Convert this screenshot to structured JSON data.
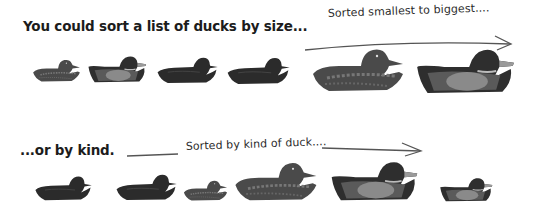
{
  "top": {
    "heading": "You could sort a list of ducks by size...",
    "annotation": "Sorted smallest to biggest....",
    "ducks": [
      {
        "kind": "female-mallard",
        "size": "smallest"
      },
      {
        "kind": "male-mallard",
        "size": "small"
      },
      {
        "kind": "dark-duck",
        "size": "medium"
      },
      {
        "kind": "dark-duck",
        "size": "medium"
      },
      {
        "kind": "female-mallard",
        "size": "big"
      },
      {
        "kind": "male-mallard",
        "size": "biggest"
      }
    ]
  },
  "bottom": {
    "heading": "...or by kind.",
    "annotation": "Sorted by kind of duck....",
    "ducks": [
      {
        "kind": "dark-duck"
      },
      {
        "kind": "dark-duck"
      },
      {
        "kind": "female-mallard"
      },
      {
        "kind": "female-mallard"
      },
      {
        "kind": "male-mallard"
      },
      {
        "kind": "male-mallard"
      }
    ]
  },
  "colors": {
    "text": "#1c1c1c",
    "arrow": "#555555",
    "dark_duck": "#2b2b2b",
    "female_body": "#4a4a4a",
    "male_head": "#262626",
    "male_side": "#8a8a8a"
  }
}
